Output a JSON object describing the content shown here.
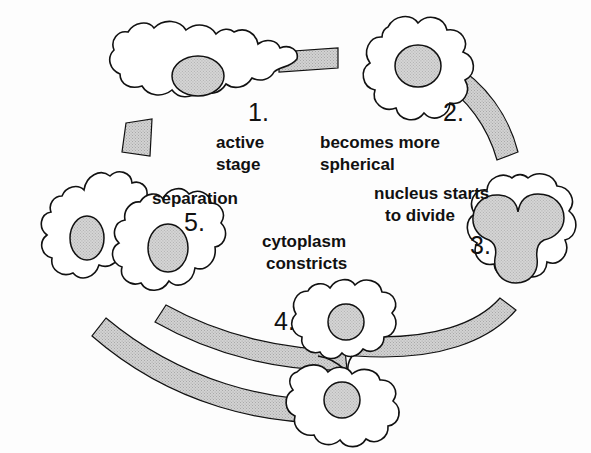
{
  "diagram": {
    "type": "cycle-diagram",
    "background_color": "#fdfdfd",
    "ink_color": "#111111",
    "band_fill": "#c9c9c9",
    "nucleus_fill": "#cfcfcf",
    "cell_fill": "#ffffff",
    "stages": [
      {
        "number": "1.",
        "label_line1": "active",
        "label_line2": "stage",
        "description": "active stage",
        "nucleus_state": "single round nucleus",
        "cell_shape": "irregular amoeboid with pseudopods"
      },
      {
        "number": "2.",
        "label_line1": "becomes more",
        "label_line2": "spherical",
        "description": "becomes more spherical",
        "nucleus_state": "single round nucleus",
        "cell_shape": "rounded lobed sphere"
      },
      {
        "number": "3.",
        "label_line1": "nucleus starts",
        "label_line2": "to divide",
        "description": "nucleus starts to divide",
        "nucleus_state": "dumbbell / constricting nucleus",
        "cell_shape": "rounded lobed sphere"
      },
      {
        "number": "4.",
        "label_line1": "cytoplasm",
        "label_line2": "constricts",
        "description": "cytoplasm constricts",
        "nucleus_state": "two separate nuclei",
        "cell_shape": "two lobes joined by thin neck"
      },
      {
        "number": "5.",
        "label_line1": "separation",
        "label_line2": "",
        "description": "separation",
        "nucleus_state": "one nucleus in each daughter cell",
        "cell_shape": "two independent amoeboid daughter cells"
      }
    ],
    "flow": {
      "direction": "clockwise",
      "band_count_upper": 1,
      "band_count_lower": 2,
      "arrowheads": [
        "stage-1-inflow-outer",
        "stage-5-inflow-inner"
      ]
    }
  }
}
